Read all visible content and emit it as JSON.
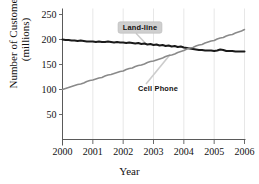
{
  "chart_data": {
    "type": "line",
    "title": "",
    "xlabel": "Year",
    "ylabel_line1": "Number of Customers",
    "ylabel_line2": "(millions)",
    "xlim": [
      2000,
      2006
    ],
    "ylim": [
      0,
      250
    ],
    "xticks": [
      "2000",
      "2001",
      "2002",
      "2003",
      "2004",
      "2005",
      "2006"
    ],
    "xtick_values": [
      2000,
      2001,
      2002,
      2003,
      2004,
      2005,
      2006
    ],
    "yticks": [
      "50",
      "100",
      "150",
      "200",
      "250"
    ],
    "ytick_values": [
      50,
      100,
      150,
      200,
      250
    ],
    "grid": "vertical-faint",
    "legend_position": "inline-annotations",
    "series": [
      {
        "name": "Land-line",
        "color": "#1a1a1a",
        "label_style": "callout-box",
        "x": [
          2000.0,
          2000.1,
          2000.2,
          2000.3,
          2000.4,
          2000.5,
          2000.6,
          2000.7,
          2000.8,
          2000.9,
          2001.0,
          2001.1,
          2001.2,
          2001.3,
          2001.4,
          2001.5,
          2001.6,
          2001.7,
          2001.8,
          2001.9,
          2002.0,
          2002.1,
          2002.2,
          2002.3,
          2002.4,
          2002.5,
          2002.6,
          2002.7,
          2002.8,
          2002.9,
          2003.0,
          2003.1,
          2003.2,
          2003.3,
          2003.4,
          2003.5,
          2003.6,
          2003.7,
          2003.8,
          2003.9,
          2004.0,
          2004.1,
          2004.2,
          2004.3,
          2004.4,
          2004.5,
          2004.6,
          2004.7,
          2004.8,
          2004.9,
          2005.0,
          2005.1,
          2005.2,
          2005.3,
          2005.4,
          2005.5,
          2005.6,
          2005.7,
          2005.8,
          2005.9,
          2006.0
        ],
        "values": [
          200,
          199,
          199,
          198,
          198,
          197,
          198,
          197,
          196,
          196,
          196,
          195,
          196,
          195,
          195,
          196,
          195,
          194,
          195,
          194,
          194,
          193,
          194,
          193,
          192,
          193,
          191,
          192,
          190,
          191,
          189,
          190,
          188,
          189,
          187,
          188,
          186,
          187,
          185,
          186,
          184,
          183,
          182,
          181,
          180,
          179,
          179,
          178,
          178,
          178,
          177,
          178,
          180,
          179,
          177,
          177,
          177,
          176,
          176,
          176,
          176
        ]
      },
      {
        "name": "Cell Phone",
        "color": "#8a8a8a",
        "label_style": "plain",
        "x": [
          2000.0,
          2000.1,
          2000.2,
          2000.3,
          2000.4,
          2000.5,
          2000.6,
          2000.7,
          2000.8,
          2000.9,
          2001.0,
          2001.1,
          2001.2,
          2001.3,
          2001.4,
          2001.5,
          2001.6,
          2001.7,
          2001.8,
          2001.9,
          2002.0,
          2002.1,
          2002.2,
          2002.3,
          2002.4,
          2002.5,
          2002.6,
          2002.7,
          2002.8,
          2002.9,
          2003.0,
          2003.1,
          2003.2,
          2003.3,
          2003.4,
          2003.5,
          2003.6,
          2003.7,
          2003.8,
          2003.9,
          2004.0,
          2004.1,
          2004.2,
          2004.3,
          2004.4,
          2004.5,
          2004.6,
          2004.7,
          2004.8,
          2004.9,
          2005.0,
          2005.1,
          2005.2,
          2005.3,
          2005.4,
          2005.5,
          2005.6,
          2005.7,
          2005.8,
          2005.9,
          2006.0
        ],
        "values": [
          100,
          102,
          104,
          106,
          108,
          110,
          111,
          113,
          116,
          118,
          119,
          121,
          123,
          124,
          127,
          129,
          130,
          132,
          134,
          136,
          137,
          140,
          142,
          143,
          146,
          148,
          149,
          151,
          154,
          156,
          157,
          159,
          161,
          163,
          166,
          168,
          169,
          171,
          174,
          176,
          178,
          181,
          183,
          184,
          187,
          189,
          190,
          193,
          195,
          197,
          198,
          201,
          203,
          204,
          207,
          209,
          210,
          213,
          215,
          217,
          220
        ]
      }
    ],
    "annotations": [
      {
        "text": "Land-line",
        "style": "callout-box"
      },
      {
        "text": "Cell Phone",
        "style": "plain"
      }
    ]
  }
}
